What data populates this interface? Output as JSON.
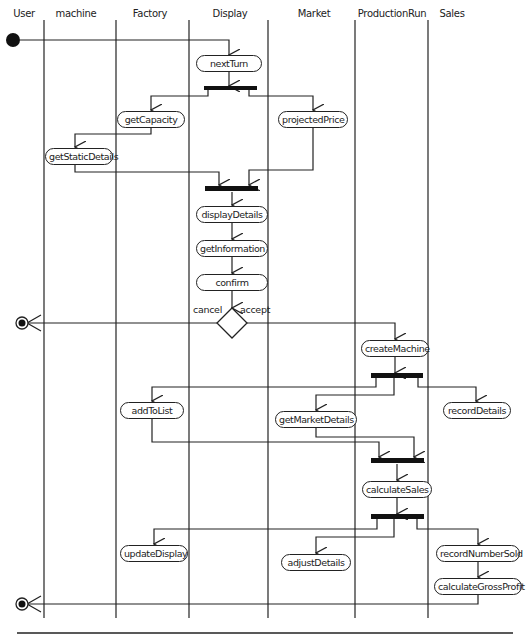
{
  "diagram": {
    "type": "UML activity diagram with swimlanes",
    "swimlanes": [
      {
        "id": "user",
        "label": "User"
      },
      {
        "id": "machine",
        "label": "machine"
      },
      {
        "id": "factory",
        "label": "Factory"
      },
      {
        "id": "display",
        "label": "Display"
      },
      {
        "id": "market",
        "label": "Market"
      },
      {
        "id": "productionrun",
        "label": "ProductionRun"
      },
      {
        "id": "sales",
        "label": "Sales"
      }
    ],
    "actions": {
      "nextTurn": "nextTurn",
      "getCapacity": "getCapacity",
      "projectedPrice": "projectedPrice",
      "getStaticDetails": "getStaticDetails",
      "displayDetails": "displayDetails",
      "getInformation": "getInformation",
      "confirm": "confirm",
      "createMachine": "createMachine",
      "addToList": "addToList",
      "recordDetails": "recordDetails",
      "getMarketDetails": "getMarketDetails",
      "calculateSales": "calculateSales",
      "updateDisplay": "updateDisplay",
      "adjustDetails": "adjustDetails",
      "recordNumberSold": "recordNumberSold",
      "calculateGrossProfit": "calculateGrossProfit"
    },
    "guards": {
      "cancel": "cancel",
      "accept": "accept"
    },
    "nodes": {
      "initial": "initial-node",
      "final_cancel": "final-node",
      "final_end": "final-node",
      "decision": "decision-node",
      "fork_bars": 5
    },
    "colors": {
      "line": "#222222",
      "background": "#ffffff",
      "bar": "#111111"
    }
  }
}
